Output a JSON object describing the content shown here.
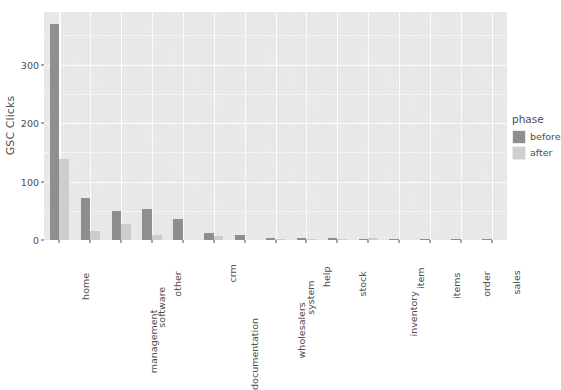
{
  "chart_data": {
    "type": "bar",
    "title": "",
    "subtitle": "",
    "xlabel": "",
    "ylabel": "GSC Clicks",
    "ylim": [
      0,
      390
    ],
    "yticks": [
      0,
      100,
      200,
      300
    ],
    "ytick_labels": [
      "0",
      "100",
      "200",
      "300"
    ],
    "grid": true,
    "grid_color": "#ffffff",
    "panel_background": "#ebebeb",
    "legend_position": "right",
    "legend_title": "phase",
    "bar_mode": "grouped",
    "categories": [
      "home",
      "management",
      "software",
      "other",
      "documentation",
      "crm",
      "wholesalers",
      "system",
      "help",
      "stock",
      "inventory",
      "item",
      "items",
      "order",
      "sales"
    ],
    "series": [
      {
        "name": "before",
        "color": "#8f8f8f",
        "values": [
          370,
          72,
          49,
          53,
          36,
          12,
          8,
          4,
          3,
          3,
          2,
          1,
          1,
          1,
          1
        ]
      },
      {
        "name": "after",
        "color": "#cfcfcf",
        "values": [
          139,
          15,
          27,
          9,
          0,
          7,
          0,
          2,
          2,
          2,
          3,
          0,
          0,
          0,
          0
        ]
      }
    ]
  },
  "axes": {
    "y_title": "GSC Clicks"
  },
  "legend": {
    "title": "phase",
    "items": [
      {
        "label": "before",
        "color": "#8f8f8f"
      },
      {
        "label": "after",
        "color": "#cfcfcf"
      }
    ]
  }
}
